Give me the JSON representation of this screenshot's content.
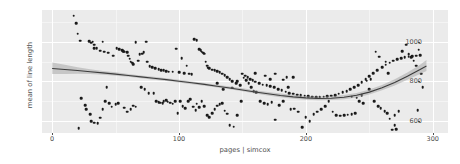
{
  "chart_data": {
    "type": "scatter",
    "title": "",
    "xlabel": "pages | simcox",
    "ylabel": "mean of line length",
    "xlim": [
      -8,
      312
    ],
    "ylim": [
      540,
      1160
    ],
    "xticks": [
      0,
      100,
      200,
      300
    ],
    "yticks": [
      600,
      800,
      1000
    ],
    "xtick_labels": [
      "0",
      "100",
      "200",
      "300"
    ],
    "ytick_labels": [
      "600",
      "800",
      "1000"
    ],
    "x_minor_ticks": [
      50,
      150,
      250
    ],
    "y_minor_ticks": [
      700,
      900,
      1100
    ],
    "grid": true,
    "legend": false,
    "panel_background": "#ebebeb",
    "grid_color": "#ffffff",
    "point_color": "#1a1a1a",
    "smooth_line_color": "#3c3c3c",
    "smooth_ribbon_color": "#9a9a9a",
    "points": [
      [
        17,
        1132
      ],
      [
        19,
        1092
      ],
      [
        20,
        1040
      ],
      [
        22,
        1005
      ],
      [
        29,
        1003
      ],
      [
        31,
        996
      ],
      [
        32,
        1000
      ],
      [
        33,
        986
      ],
      [
        33,
        967
      ],
      [
        35,
        968
      ],
      [
        38,
        955
      ],
      [
        40,
        1000
      ],
      [
        41,
        949
      ],
      [
        44,
        945
      ],
      [
        48,
        930
      ],
      [
        51,
        966
      ],
      [
        53,
        963
      ],
      [
        55,
        957
      ],
      [
        56,
        952
      ],
      [
        57,
        950
      ],
      [
        59,
        947
      ],
      [
        60,
        930
      ],
      [
        61,
        915
      ],
      [
        62,
        900
      ],
      [
        63,
        895
      ],
      [
        64,
        888
      ],
      [
        66,
        998
      ],
      [
        68,
        905
      ],
      [
        69,
        937
      ],
      [
        71,
        940
      ],
      [
        72,
        948
      ],
      [
        74,
        1000
      ],
      [
        75,
        900
      ],
      [
        77,
        878
      ],
      [
        79,
        872
      ],
      [
        81,
        868
      ],
      [
        84,
        862
      ],
      [
        86,
        858
      ],
      [
        88,
        856
      ],
      [
        90,
        852
      ],
      [
        92,
        850
      ],
      [
        95,
        848
      ],
      [
        98,
        965
      ],
      [
        100,
        846
      ],
      [
        102,
        918
      ],
      [
        104,
        840
      ],
      [
        106,
        880
      ],
      [
        108,
        838
      ],
      [
        110,
        836
      ],
      [
        112,
        1013
      ],
      [
        114,
        1008
      ],
      [
        116,
        962
      ],
      [
        117,
        958
      ],
      [
        118,
        950
      ],
      [
        119,
        944
      ],
      [
        120,
        940
      ],
      [
        121,
        900
      ],
      [
        122,
        880
      ],
      [
        123,
        870
      ],
      [
        124,
        866
      ],
      [
        126,
        860
      ],
      [
        128,
        856
      ],
      [
        130,
        852
      ],
      [
        132,
        846
      ],
      [
        134,
        838
      ],
      [
        136,
        830
      ],
      [
        138,
        822
      ],
      [
        140,
        810
      ],
      [
        142,
        800
      ],
      [
        145,
        790
      ],
      [
        148,
        782
      ],
      [
        150,
        838
      ],
      [
        152,
        828
      ],
      [
        154,
        820
      ],
      [
        156,
        812
      ],
      [
        158,
        805
      ],
      [
        160,
        798
      ],
      [
        163,
        790
      ],
      [
        166,
        784
      ],
      [
        169,
        780
      ],
      [
        172,
        775
      ],
      [
        175,
        770
      ],
      [
        178,
        762
      ],
      [
        181,
        755
      ],
      [
        184,
        748
      ],
      [
        187,
        742
      ],
      [
        190,
        738
      ],
      [
        193,
        734
      ],
      [
        196,
        730
      ],
      [
        199,
        727
      ],
      [
        202,
        724
      ],
      [
        205,
        722
      ],
      [
        208,
        721
      ],
      [
        211,
        721
      ],
      [
        214,
        722
      ],
      [
        217,
        724
      ],
      [
        220,
        727
      ],
      [
        223,
        732
      ],
      [
        226,
        738
      ],
      [
        229,
        745
      ],
      [
        232,
        752
      ],
      [
        235,
        760
      ],
      [
        238,
        770
      ],
      [
        241,
        782
      ],
      [
        244,
        795
      ],
      [
        247,
        810
      ],
      [
        250,
        826
      ],
      [
        253,
        842
      ],
      [
        256,
        858
      ],
      [
        260,
        872
      ],
      [
        263,
        884
      ],
      [
        266,
        895
      ],
      [
        269,
        905
      ],
      [
        272,
        912
      ],
      [
        275,
        918
      ],
      [
        278,
        922
      ],
      [
        281,
        925
      ],
      [
        284,
        928
      ],
      [
        287,
        930
      ],
      [
        290,
        932
      ],
      [
        23,
        716
      ],
      [
        26,
        680
      ],
      [
        27,
        660
      ],
      [
        30,
        635
      ],
      [
        31,
        600
      ],
      [
        33,
        592
      ],
      [
        36,
        588
      ],
      [
        38,
        618
      ],
      [
        40,
        660
      ],
      [
        42,
        700
      ],
      [
        43,
        770
      ],
      [
        45,
        690
      ],
      [
        47,
        672
      ],
      [
        50,
        685
      ],
      [
        52,
        690
      ],
      [
        21,
        565
      ],
      [
        57,
        668
      ],
      [
        59,
        648
      ],
      [
        62,
        660
      ],
      [
        64,
        677
      ],
      [
        66,
        672
      ],
      [
        70,
        770
      ],
      [
        73,
        760
      ],
      [
        76,
        742
      ],
      [
        80,
        740
      ],
      [
        82,
        700
      ],
      [
        84,
        695
      ],
      [
        85,
        692
      ],
      [
        87,
        690
      ],
      [
        88,
        700
      ],
      [
        90,
        705
      ],
      [
        91,
        697
      ],
      [
        93,
        692
      ],
      [
        95,
        688
      ],
      [
        97,
        700
      ],
      [
        99,
        640
      ],
      [
        101,
        700
      ],
      [
        103,
        675
      ],
      [
        105,
        665
      ],
      [
        107,
        700
      ],
      [
        109,
        710
      ],
      [
        111,
        672
      ],
      [
        113,
        655
      ],
      [
        114,
        688
      ],
      [
        116,
        670
      ],
      [
        118,
        700
      ],
      [
        120,
        676
      ],
      [
        122,
        630
      ],
      [
        124,
        620
      ],
      [
        126,
        640
      ],
      [
        128,
        660
      ],
      [
        130,
        678
      ],
      [
        132,
        685
      ],
      [
        134,
        690
      ],
      [
        136,
        652
      ],
      [
        138,
        638
      ],
      [
        140,
        580
      ],
      [
        143,
        572
      ],
      [
        146,
        630
      ],
      [
        149,
        700
      ],
      [
        151,
        818
      ],
      [
        153,
        805
      ],
      [
        155,
        790
      ],
      [
        157,
        770
      ],
      [
        159,
        752
      ],
      [
        161,
        745
      ],
      [
        164,
        700
      ],
      [
        167,
        690
      ],
      [
        170,
        686
      ],
      [
        173,
        694
      ],
      [
        176,
        608
      ],
      [
        179,
        680
      ],
      [
        182,
        808
      ],
      [
        185,
        820
      ],
      [
        188,
        660
      ],
      [
        191,
        662
      ],
      [
        194,
        648
      ],
      [
        197,
        570
      ],
      [
        200,
        620
      ],
      [
        203,
        600
      ],
      [
        206,
        636
      ],
      [
        209,
        648
      ],
      [
        212,
        660
      ],
      [
        215,
        676
      ],
      [
        218,
        700
      ],
      [
        221,
        648
      ],
      [
        224,
        630
      ],
      [
        227,
        628
      ],
      [
        230,
        630
      ],
      [
        233,
        632
      ],
      [
        236,
        634
      ],
      [
        239,
        640
      ],
      [
        242,
        700
      ],
      [
        245,
        690
      ],
      [
        248,
        804
      ],
      [
        251,
        812
      ],
      [
        254,
        700
      ],
      [
        257,
        676
      ],
      [
        259,
        664
      ],
      [
        262,
        650
      ],
      [
        264,
        640
      ],
      [
        266,
        612
      ],
      [
        268,
        556
      ],
      [
        270,
        630
      ],
      [
        271,
        560
      ],
      [
        273,
        650
      ],
      [
        276,
        952
      ],
      [
        279,
        986
      ],
      [
        281,
        938
      ],
      [
        283,
        922
      ],
      [
        285,
        905
      ],
      [
        287,
        880
      ],
      [
        289,
        960
      ],
      [
        291,
        838
      ],
      [
        292,
        772
      ],
      [
        288,
        654
      ],
      [
        270,
        580
      ],
      [
        265,
        840
      ],
      [
        263,
        900
      ],
      [
        258,
        924
      ],
      [
        255,
        950
      ],
      [
        250,
        762
      ],
      [
        244,
        730
      ],
      [
        240,
        718
      ],
      [
        236,
        722
      ],
      [
        190,
        820
      ],
      [
        186,
        770
      ],
      [
        182,
        700
      ],
      [
        176,
        838
      ],
      [
        172,
        810
      ],
      [
        168,
        828
      ],
      [
        160,
        842
      ],
      [
        146,
        800
      ],
      [
        142,
        768
      ],
      [
        135,
        760
      ],
      [
        130,
        790
      ]
    ],
    "smooth_curve": [
      [
        0,
        865
      ],
      [
        10,
        860
      ],
      [
        20,
        855
      ],
      [
        30,
        849
      ],
      [
        40,
        843
      ],
      [
        50,
        837
      ],
      [
        60,
        830
      ],
      [
        70,
        823
      ],
      [
        80,
        816
      ],
      [
        90,
        809
      ],
      [
        100,
        801
      ],
      [
        110,
        793
      ],
      [
        120,
        785
      ],
      [
        130,
        776
      ],
      [
        140,
        767
      ],
      [
        150,
        757
      ],
      [
        160,
        747
      ],
      [
        170,
        738
      ],
      [
        180,
        729
      ],
      [
        190,
        722
      ],
      [
        200,
        717
      ],
      [
        210,
        714
      ],
      [
        220,
        715
      ],
      [
        230,
        720
      ],
      [
        240,
        730
      ],
      [
        250,
        746
      ],
      [
        260,
        768
      ],
      [
        270,
        795
      ],
      [
        280,
        826
      ],
      [
        290,
        860
      ],
      [
        295,
        878
      ]
    ],
    "smooth_ribbon_upper": [
      [
        0,
        895
      ],
      [
        10,
        884
      ],
      [
        20,
        872
      ],
      [
        30,
        861
      ],
      [
        40,
        853
      ],
      [
        50,
        846
      ],
      [
        60,
        838
      ],
      [
        70,
        830
      ],
      [
        80,
        823
      ],
      [
        90,
        816
      ],
      [
        100,
        808
      ],
      [
        110,
        800
      ],
      [
        120,
        792
      ],
      [
        130,
        783
      ],
      [
        140,
        774
      ],
      [
        150,
        765
      ],
      [
        160,
        756
      ],
      [
        170,
        747
      ],
      [
        180,
        739
      ],
      [
        190,
        732
      ],
      [
        200,
        727
      ],
      [
        210,
        724
      ],
      [
        220,
        725
      ],
      [
        230,
        731
      ],
      [
        240,
        742
      ],
      [
        250,
        759
      ],
      [
        260,
        782
      ],
      [
        270,
        811
      ],
      [
        280,
        845
      ],
      [
        290,
        884
      ],
      [
        295,
        908
      ]
    ],
    "smooth_ribbon_lower": [
      [
        0,
        838
      ],
      [
        10,
        838
      ],
      [
        20,
        839
      ],
      [
        30,
        838
      ],
      [
        40,
        834
      ],
      [
        50,
        829
      ],
      [
        60,
        823
      ],
      [
        70,
        816
      ],
      [
        80,
        809
      ],
      [
        90,
        802
      ],
      [
        100,
        794
      ],
      [
        110,
        786
      ],
      [
        120,
        778
      ],
      [
        130,
        769
      ],
      [
        140,
        760
      ],
      [
        150,
        750
      ],
      [
        160,
        739
      ],
      [
        170,
        729
      ],
      [
        180,
        720
      ],
      [
        190,
        713
      ],
      [
        200,
        708
      ],
      [
        210,
        705
      ],
      [
        220,
        706
      ],
      [
        230,
        710
      ],
      [
        240,
        719
      ],
      [
        250,
        734
      ],
      [
        260,
        755
      ],
      [
        270,
        780
      ],
      [
        280,
        808
      ],
      [
        290,
        838
      ],
      [
        295,
        852
      ]
    ]
  }
}
